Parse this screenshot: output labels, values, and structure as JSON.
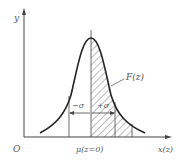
{
  "diagram": {
    "axes": {
      "y_label": "y",
      "x_label": "x(z)",
      "origin_label": "O"
    },
    "labels": {
      "mean": "μ(z=0)",
      "minus_sigma": "−σ",
      "plus_sigma": "+σ",
      "area": "F(z)"
    },
    "colors": {
      "stroke": "#333333",
      "text": "#555555",
      "hatch": "#555555",
      "background": "#ffffff"
    }
  }
}
